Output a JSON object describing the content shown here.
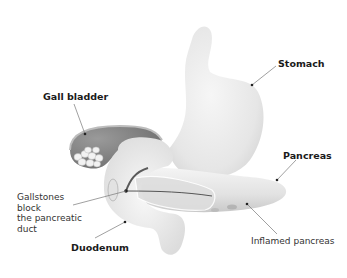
{
  "diagram": {
    "title": "",
    "colors": {
      "organ_fill": "#ececec",
      "organ_shade": "#d4d4d4",
      "gallbladder_fill": "#8a8a8a",
      "stone_fill": "#f2f2f2",
      "duct_line": "#555555",
      "leader_line": "#666666",
      "inflamed": "#9a9a9a"
    },
    "labels": {
      "stomach": "Stomach",
      "gall_bladder": "Gall bladder",
      "pancreas": "Pancreas",
      "gallstones_line1": "Gallstones",
      "gallstones_line2": "block",
      "gallstones_line3": "the pancreatic",
      "gallstones_line4": "duct",
      "duodenum": "Duodenum",
      "inflamed_pancreas": "Inflamed pancreas"
    }
  }
}
